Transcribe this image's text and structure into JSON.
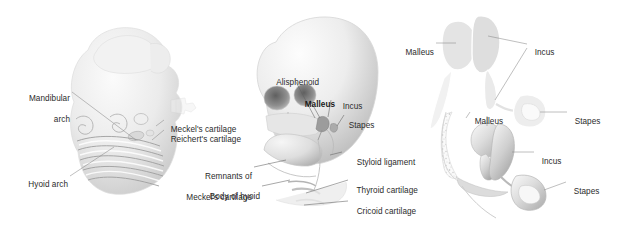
{
  "figure": {
    "background_color": "#ffffff",
    "label_color": "#2b2b2b",
    "artwork_fill_light": "#ececec",
    "artwork_fill_mid": "#d5d5d5",
    "artwork_fill_dark": "#9b9b9b",
    "outline_color": "#ffffff",
    "leader_color": "#7d7d7d"
  },
  "panels": [
    {
      "id": "embryo",
      "name": "embryo-head-pharyngeal-arches",
      "labels": [
        {
          "id": "mandibular-arch",
          "text_lines": [
            "Mandibular",
            "arch"
          ],
          "align": "right"
        },
        {
          "id": "hyoid-arch",
          "text_lines": [
            "Hyoid arch"
          ],
          "align": "right"
        },
        {
          "id": "meckels-cartilage",
          "text_lines": [
            "Meckel's cartilage"
          ],
          "align": "left"
        },
        {
          "id": "reicherts-cartilage",
          "text_lines": [
            "Reichert's cartilage"
          ],
          "align": "left"
        }
      ]
    },
    {
      "id": "skull",
      "name": "fetal-skull-derivatives",
      "labels": [
        {
          "id": "alisphenoid",
          "text_lines": [
            "Alisphenoid"
          ],
          "align": "left",
          "bold": false
        },
        {
          "id": "malleus",
          "text_lines": [
            "Malleus"
          ],
          "align": "left",
          "bold": true
        },
        {
          "id": "incus",
          "text_lines": [
            "Incus"
          ],
          "align": "left",
          "bold": false
        },
        {
          "id": "stapes",
          "text_lines": [
            "Stapes"
          ],
          "align": "left",
          "bold": false
        },
        {
          "id": "remnants-of-meckels-cartilage",
          "text_lines": [
            "Remnants of",
            "Meckel's cartilage"
          ],
          "align": "right"
        },
        {
          "id": "body-of-hyoid",
          "text_lines": [
            "Body of hyoid"
          ],
          "align": "right"
        },
        {
          "id": "styloid-ligament",
          "text_lines": [
            "Styloid ligament"
          ],
          "align": "left"
        },
        {
          "id": "thyroid-cartilage",
          "text_lines": [
            "Thyroid cartilage"
          ],
          "align": "left"
        },
        {
          "id": "cricoid-cartilage",
          "text_lines": [
            "Cricoid cartilage"
          ],
          "align": "left"
        }
      ]
    },
    {
      "id": "ossicle-schematic",
      "name": "ossicle-chain-schematic",
      "labels": [
        {
          "id": "malleus",
          "text_lines": [
            "Malleus"
          ],
          "align": "right"
        },
        {
          "id": "incus",
          "text_lines": [
            "Incus"
          ],
          "align": "left"
        },
        {
          "id": "stapes",
          "text_lines": [
            "Stapes"
          ],
          "align": "left"
        }
      ]
    },
    {
      "id": "ossicle-3d",
      "name": "ossicle-three-dimensional-view",
      "labels": [
        {
          "id": "malleus",
          "text_lines": [
            "Malleus"
          ],
          "align": "left"
        },
        {
          "id": "incus",
          "text_lines": [
            "Incus"
          ],
          "align": "left"
        },
        {
          "id": "stapes",
          "text_lines": [
            "Stapes"
          ],
          "align": "left"
        }
      ]
    }
  ],
  "labels": {
    "embryo": {
      "mandibular_arch_l1": "Mandibular",
      "mandibular_arch_l2": "arch",
      "hyoid_arch": "Hyoid arch",
      "meckels_cartilage": "Meckel's cartilage",
      "reicherts_cartilage": "Reichert's cartilage"
    },
    "skull": {
      "alisphenoid": "Alisphenoid",
      "malleus": "Malleus",
      "incus": "Incus",
      "stapes": "Stapes",
      "remnants_l1": "Remnants of",
      "remnants_l2": "Meckel's cartilage",
      "body_of_hyoid": "Body of hyoid",
      "styloid_ligament": "Styloid ligament",
      "thyroid_cartilage": "Thyroid cartilage",
      "cricoid_cartilage": "Cricoid cartilage"
    },
    "schematic": {
      "malleus": "Malleus",
      "incus": "Incus",
      "stapes": "Stapes"
    },
    "ossicle3d": {
      "malleus": "Malleus",
      "incus": "Incus",
      "stapes": "Stapes"
    }
  }
}
